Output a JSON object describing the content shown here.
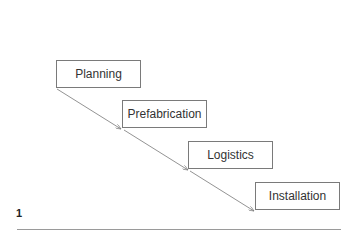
{
  "diagram": {
    "type": "waterfall-process",
    "steps": [
      {
        "label": "Planning"
      },
      {
        "label": "Prefabrication"
      },
      {
        "label": "Logistics"
      },
      {
        "label": "Installation"
      }
    ],
    "figure_number": "1",
    "colors": {
      "border": "#7a7a7a",
      "arrow": "#777777",
      "text": "#333333"
    }
  }
}
